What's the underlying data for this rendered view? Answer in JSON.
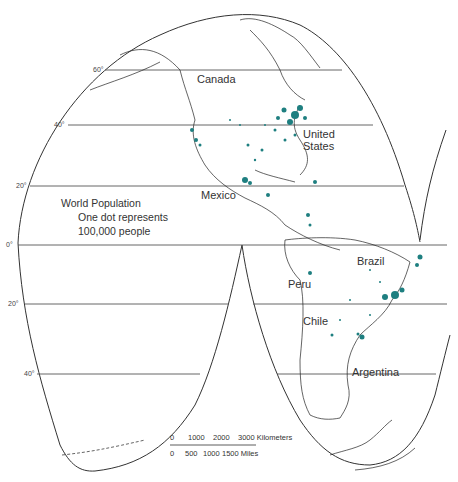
{
  "map": {
    "projection": "interrupted Goode homolosine (Americas lobes)",
    "colors": {
      "outline": "#333333",
      "graticule": "#555555",
      "dots": "#1e7f80",
      "coast": "#222222",
      "background": "#ffffff"
    },
    "latitude_labels": [
      "60°",
      "40°",
      "20°",
      "0°",
      "20°",
      "40°"
    ],
    "country_labels": {
      "canada": "Canada",
      "united_states_1": "United",
      "united_states_2": "States",
      "mexico": "Mexico",
      "brazil": "Brazil",
      "peru": "Peru",
      "chile": "Chile",
      "argentina": "Argentina"
    },
    "legend": {
      "title": "World Population",
      "line1": "One dot represents",
      "line2": "100,000 people"
    },
    "scale_bar": {
      "km_ticks": [
        "0",
        "1000",
        "2000",
        "3000 Kilometers"
      ],
      "mile_ticks": [
        "0",
        "500",
        "1000",
        "1500 Miles"
      ]
    }
  }
}
